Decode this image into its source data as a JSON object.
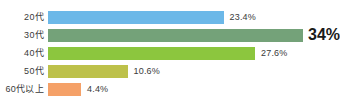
{
  "chart_data": {
    "type": "bar",
    "orientation": "horizontal",
    "title": "",
    "subtitle": "",
    "xlabel": "",
    "ylabel": "",
    "xlim": [
      0,
      36
    ],
    "grid": false,
    "legend": false,
    "categories": [
      "20代",
      "30代",
      "40代",
      "50代",
      "60代以上"
    ],
    "values": [
      23.4,
      34,
      27.6,
      10.6,
      4.4
    ],
    "value_labels": [
      "23.4%",
      "34%",
      "27.6%",
      "10.6%",
      "4.4%"
    ],
    "colors": [
      "#6CB8E8",
      "#74A279",
      "#8CC63E",
      "#BDC14A",
      "#F5A168"
    ],
    "emphasis_index": 1,
    "bars": [
      {
        "category": "20代",
        "value": 23.4,
        "value_label": "23.4%",
        "color": "#6CB8E8",
        "emphasis": false
      },
      {
        "category": "30代",
        "value": 34,
        "value_label": "34%",
        "color": "#74A279",
        "emphasis": true
      },
      {
        "category": "40代",
        "value": 27.6,
        "value_label": "27.6%",
        "color": "#8CC63E",
        "emphasis": false
      },
      {
        "category": "50代",
        "value": 10.6,
        "value_label": "10.6%",
        "color": "#BDC14A",
        "emphasis": false
      },
      {
        "category": "60代以上",
        "value": 4.4,
        "value_label": "4.4%",
        "color": "#F5A168",
        "emphasis": false
      }
    ]
  },
  "style": {
    "background": "#FFFFFF",
    "label_color": "#3A3A3A",
    "emphasis_color": "#1A1A1A"
  }
}
